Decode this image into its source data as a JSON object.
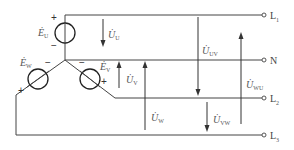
{
  "diagram": {
    "type": "three-phase star-connected source with neutral",
    "terminals": [
      {
        "id": "L1",
        "label": "L",
        "sub": "1"
      },
      {
        "id": "N",
        "label": "N",
        "sub": ""
      },
      {
        "id": "L2",
        "label": "L",
        "sub": "2"
      },
      {
        "id": "L3",
        "label": "L",
        "sub": "3"
      }
    ],
    "sources": [
      {
        "id": "EU",
        "label": "Ė",
        "sub": "U",
        "plus": "+",
        "minus": "−"
      },
      {
        "id": "EV",
        "label": "Ė",
        "sub": "V",
        "plus": "+",
        "minus": "−"
      },
      {
        "id": "EW",
        "label": "Ė",
        "sub": "W",
        "plus": "+",
        "minus": "−"
      }
    ],
    "phase_voltages": [
      {
        "id": "UU",
        "label": "U̇",
        "sub": "U",
        "direction": "down"
      },
      {
        "id": "UV",
        "label": "U̇",
        "sub": "V",
        "direction": "up"
      },
      {
        "id": "UW",
        "label": "U̇",
        "sub": "W",
        "direction": "up"
      }
    ],
    "line_voltages": [
      {
        "id": "UUV",
        "label": "U̇",
        "sub": "UV",
        "direction": "down"
      },
      {
        "id": "UVW",
        "label": "U̇",
        "sub": "VW",
        "direction": "down"
      },
      {
        "id": "UWU",
        "label": "U̇",
        "sub": "WU",
        "direction": "up"
      }
    ],
    "colors": {
      "line": "#444444",
      "text": "#555555",
      "background": "#ffffff"
    }
  }
}
